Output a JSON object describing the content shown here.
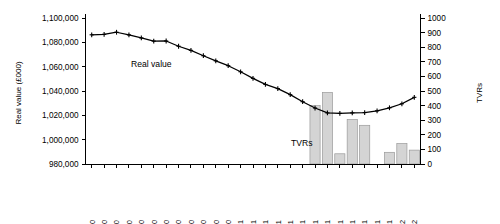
{
  "chart_data": {
    "type": "line",
    "title": "",
    "subtitle": "",
    "grid": false,
    "legend_position": "inline-annotation",
    "xlabel": "",
    "ylabel": "Real value (£000)",
    "y2label": "TVRs",
    "ylim": [
      980000,
      1100000
    ],
    "ytick_step": 20000,
    "y2lim": [
      0,
      1000
    ],
    "y2tick_step": 100,
    "ytick_labels": [
      "980,000",
      "1,000,000",
      "1,020,000",
      "1,040,000",
      "1,060,000",
      "1,080,000",
      "1,100,000"
    ],
    "ytick_values": [
      980000,
      1000000,
      1020000,
      1040000,
      1060000,
      1080000,
      1100000
    ],
    "y2tick_labels": [
      "0",
      "100",
      "200",
      "300",
      "400",
      "500",
      "600",
      "700",
      "800",
      "900",
      "1000"
    ],
    "y2tick_values": [
      0,
      100,
      200,
      300,
      400,
      500,
      600,
      700,
      800,
      900,
      1000
    ],
    "categories": [
      "06 Feb 00",
      "05 Mar 00",
      "02 Apr 00",
      "30 Apr 00",
      "28 May 00",
      "25 Jun 00",
      "23 Jul 00",
      "20 Aug 00",
      "17 Sep 00",
      "15 Oct 00",
      "12 Nov 00",
      "10 Dec 00",
      "07 Jan 01",
      "04 Feb 01",
      "04 Mar 01",
      "01 Apr 01",
      "29 Apr 01",
      "27 May 01",
      "24 Jun 01",
      "22 Jul 01",
      "19 Aug 01",
      "16 Sep 01",
      "14 Oct 01",
      "11 Nov 01",
      "09 Dec 01",
      "06 Jan 02",
      "03 Feb 02"
    ],
    "series": [
      {
        "name": "Real value",
        "type": "line",
        "axis": "left",
        "annotation": "Real value",
        "color": "#000000",
        "values": [
          1086200,
          1086600,
          1088300,
          1086100,
          1083600,
          1081000,
          1081100,
          1076800,
          1073400,
          1069000,
          1064800,
          1060800,
          1055800,
          1050400,
          1045400,
          1042000,
          1037000,
          1031200,
          1026000,
          1022000,
          1021600,
          1022000,
          1022300,
          1023700,
          1026200,
          1029500,
          1034800
        ]
      },
      {
        "name": "TVRs",
        "type": "bar",
        "axis": "right",
        "annotation": "TVRs",
        "color": "#d4d4d4",
        "values": [
          0,
          0,
          0,
          0,
          0,
          0,
          0,
          0,
          0,
          0,
          0,
          0,
          0,
          0,
          0,
          0,
          0,
          0,
          400,
          490,
          70,
          305,
          265,
          0,
          80,
          140,
          95
        ]
      }
    ]
  }
}
